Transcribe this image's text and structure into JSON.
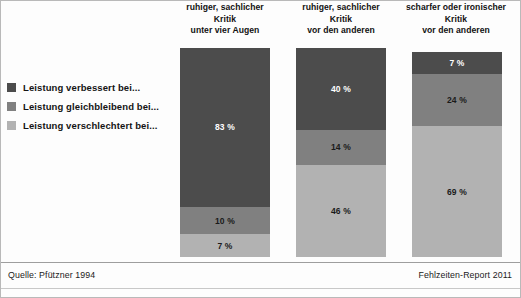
{
  "colors": {
    "improved": "#4c4c4c",
    "unchanged": "#808080",
    "worsened": "#b2b2b2",
    "background": "#fdfdfd",
    "text": "#121212"
  },
  "legend": {
    "items": [
      {
        "label": "Leistung verbessert bei...",
        "swatch": "#4c4c4c",
        "key": "improved"
      },
      {
        "label": "Leistung gleichbleibend bei...",
        "swatch": "#808080",
        "key": "unchanged"
      },
      {
        "label": "Leistung verschlechtert bei...",
        "swatch": "#b2b2b2",
        "key": "worsened"
      }
    ]
  },
  "headers": [
    {
      "line1": "ruhiger, sachlicher",
      "line2": "Kritik",
      "line3": "unter vier Augen"
    },
    {
      "line1": "ruhiger, sachlicher",
      "line2": "Kritik",
      "line3": "vor den anderen"
    },
    {
      "line1": "scharfer oder ironischer",
      "line2": "Kritik",
      "line3": "vor den anderen"
    }
  ],
  "bars": [
    {
      "segments": [
        {
          "label": "83 %",
          "value": 83
        },
        {
          "label": "10 %",
          "value": 10
        },
        {
          "label": "7 %",
          "value": 7
        }
      ]
    },
    {
      "segments": [
        {
          "label": "40 %",
          "value": 40
        },
        {
          "label": "14 %",
          "value": 14
        },
        {
          "label": "46 %",
          "value": 46
        }
      ]
    },
    {
      "segments": [
        {
          "label": "7 %",
          "value": 7
        },
        {
          "label": "24 %",
          "value": 24
        },
        {
          "label": "69 %",
          "value": 69
        }
      ]
    }
  ],
  "footer": {
    "source": "Quelle: Pfützner 1994",
    "report": "Fehlzeiten-Report 2011"
  },
  "chart_data": {
    "type": "bar",
    "subtype": "stacked-100-percent",
    "orientation": "vertical",
    "title": "",
    "xlabel": "",
    "ylabel": "",
    "ylim": [
      0,
      100
    ],
    "grid": false,
    "legend_position": "left",
    "value_unit": "%",
    "categories": [
      "ruhiger, sachlicher Kritik unter vier Augen",
      "ruhiger, sachlicher Kritik vor den anderen",
      "scharfer oder ironischer Kritik vor den anderen"
    ],
    "series": [
      {
        "name": "Leistung verbessert bei...",
        "color": "#4c4c4c",
        "values": [
          83,
          40,
          7
        ]
      },
      {
        "name": "Leistung gleichbleibend bei...",
        "color": "#808080",
        "values": [
          10,
          14,
          24
        ]
      },
      {
        "name": "Leistung verschlechtert bei...",
        "color": "#b2b2b2",
        "values": [
          7,
          46,
          69
        ]
      }
    ],
    "annotations": {
      "source": "Quelle: Pfützner 1994",
      "report": "Fehlzeiten-Report 2011"
    }
  }
}
